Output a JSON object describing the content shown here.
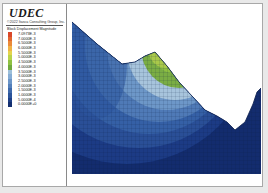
{
  "header": {
    "app_title": "UDEC",
    "copyright": "©2022 Itasca Consulting Group, Inc."
  },
  "legend": {
    "title": "Block Displacement Magnitude",
    "entries": [
      {
        "label": "7.0973E-3",
        "color": "#d9482a"
      },
      {
        "label": "7.0000E-3",
        "color": "#e2652e"
      },
      {
        "label": "6.5000E-3",
        "color": "#eb8a38"
      },
      {
        "label": "6.0000E-3",
        "color": "#f0b245"
      },
      {
        "label": "5.5000E-3",
        "color": "#e4d44c"
      },
      {
        "label": "5.0000E-3",
        "color": "#b9d34a"
      },
      {
        "label": "4.5000E-3",
        "color": "#8fc142"
      },
      {
        "label": "4.0000E-3",
        "color": "#6fa83f"
      },
      {
        "label": "3.5000E-3",
        "color": "#9dbfd9"
      },
      {
        "label": "3.0000E-3",
        "color": "#86acd4"
      },
      {
        "label": "2.5000E-3",
        "color": "#6b95c8"
      },
      {
        "label": "2.0000E-3",
        "color": "#537fba"
      },
      {
        "label": "1.5000E-3",
        "color": "#3d68aa"
      },
      {
        "label": "1.0000E-3",
        "color": "#2a5399"
      },
      {
        "label": "5.0000E-4",
        "color": "#1d3f86"
      },
      {
        "label": "0.0000E+0",
        "color": "#142f70"
      }
    ]
  },
  "plot": {
    "description": "Slope mesh colored by block displacement magnitude",
    "colors": {
      "deep": "#132c6e",
      "dark": "#1c3b85",
      "mid": "#3560a6",
      "light": "#6d97c8",
      "pale": "#a7c4dc",
      "green": "#6ea33b",
      "yellowgreen": "#a9c94a",
      "mesh": "#0b1a40"
    }
  }
}
